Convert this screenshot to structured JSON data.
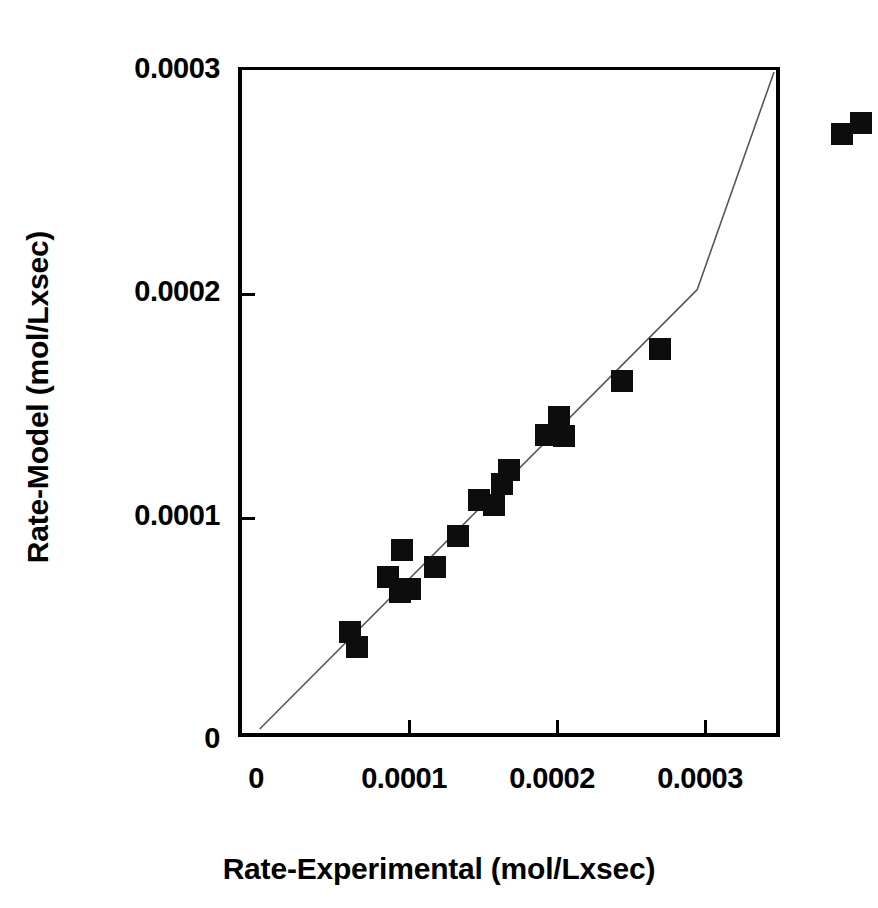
{
  "chart_data": {
    "type": "scatter",
    "title": "",
    "xlabel": "Rate-Experimental (mol/Lxsec)",
    "ylabel": "Rate-Model (mol/Lxsec)",
    "xlim": [
      0,
      0.0003
    ],
    "ylim": [
      0,
      0.0003
    ],
    "xticks": [
      0,
      0.0001,
      0.0002,
      0.0003
    ],
    "yticks": [
      0,
      0.0001,
      0.0002,
      0.0003
    ],
    "xticklabels": [
      "0",
      "0.0001",
      "0.0002",
      "0.0003"
    ],
    "yticklabels": [
      "0",
      "0.0001",
      "0.0002",
      "0.0003"
    ],
    "grid": false,
    "legend": null,
    "legend_position": "none",
    "marker_shape": "square",
    "marker_color": "#0d0d0d",
    "reference_line": {
      "name": "parity-line",
      "description": "y = x diagonal from origin to upper-right corner",
      "color": "#555555",
      "from": [
        0,
        0
      ],
      "to": [
        0.0003,
        0.0003
      ]
    },
    "series": [
      {
        "name": "Model vs Experimental rate",
        "points": [
          {
            "x": 4.05e-05,
            "y": 4.68e-05
          },
          {
            "x": 4.35e-05,
            "y": 4.02e-05
          },
          {
            "x": 5.75e-05,
            "y": 7.15e-05
          },
          {
            "x": 6.3e-05,
            "y": 6.47e-05
          },
          {
            "x": 6.4e-05,
            "y": 8.4e-05
          },
          {
            "x": 6.75e-05,
            "y": 6.63e-05
          },
          {
            "x": 7.9e-05,
            "y": 7.62e-05
          },
          {
            "x": 8.9e-05,
            "y": 9.02e-05
          },
          {
            "x": 9.85e-05,
            "y": 0.0001062
          },
          {
            "x": 0.0001055,
            "y": 0.0001042
          },
          {
            "x": 0.000109,
            "y": 0.0001135
          },
          {
            "x": 0.000112,
            "y": 0.00012
          },
          {
            "x": 0.000129,
            "y": 0.0001355
          },
          {
            "x": 0.0001345,
            "y": 0.0001435
          },
          {
            "x": 0.000137,
            "y": 0.000135
          },
          {
            "x": 0.000163,
            "y": 0.00016
          },
          {
            "x": 0.00018,
            "y": 0.0001745
          },
          {
            "x": 0.000262,
            "y": 0.0002712
          },
          {
            "x": 0.0002705,
            "y": 0.000276
          }
        ]
      }
    ]
  },
  "axes": {
    "x_title": "Rate-Experimental (mol/Lxsec)",
    "y_title": "Rate-Model (mol/Lxsec)",
    "x_tick_labels": [
      "0",
      "0.0001",
      "0.0002",
      "0.0003"
    ],
    "y_tick_labels": [
      "0",
      "0.0001",
      "0.0002",
      "0.0003"
    ]
  },
  "colors": {
    "marker": "#0d0d0d",
    "axis": "#000000",
    "parity_line": "#555555",
    "background": "#ffffff"
  }
}
